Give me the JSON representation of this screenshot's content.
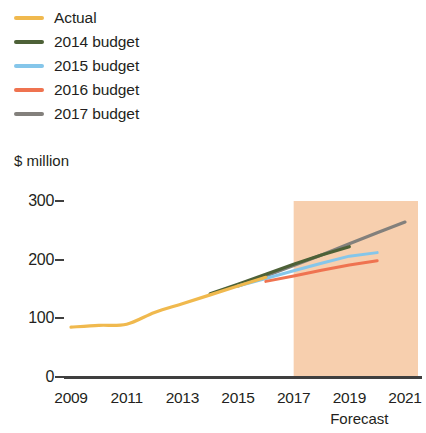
{
  "legend": {
    "items": [
      {
        "label": "Actual",
        "color": "#f0b94e",
        "key": "actual"
      },
      {
        "label": "2014 budget",
        "color": "#4d6137",
        "key": "budget2014"
      },
      {
        "label": "2015 budget",
        "color": "#85c6ea",
        "key": "budget2015"
      },
      {
        "label": "2016 budget",
        "color": "#ef7350",
        "key": "budget2016"
      },
      {
        "label": "2017 budget",
        "color": "#83807c",
        "key": "budget2017"
      }
    ]
  },
  "axes": {
    "y_title": "$ million",
    "y_ticks": [
      "300",
      "200",
      "100",
      "0"
    ],
    "x_ticks": [
      "2009",
      "2011",
      "2013",
      "2015",
      "2017",
      "2019",
      "2021"
    ],
    "forecast_caption": "Forecast"
  },
  "colors": {
    "forecast_band": "#f7cfae",
    "axis": "#3f3f3f",
    "text": "#231f20"
  },
  "chart_data": {
    "type": "line",
    "title": "",
    "xlabel": "",
    "ylabel": "$ million",
    "xlim": [
      2009,
      2021
    ],
    "ylim": [
      0,
      300
    ],
    "yticks": [
      0,
      100,
      200,
      300
    ],
    "xticks": [
      2009,
      2011,
      2013,
      2015,
      2017,
      2019,
      2021
    ],
    "grid": false,
    "legend_position": "top-left",
    "annotations": [
      {
        "text": "Forecast",
        "x_start": 2017,
        "x_end": 2021,
        "type": "shaded-band",
        "color": "#f7cfae"
      }
    ],
    "series": [
      {
        "name": "Actual",
        "color": "#f0b94e",
        "x": [
          2009,
          2010,
          2011,
          2012,
          2013,
          2014,
          2015,
          2016
        ],
        "values": [
          85,
          88,
          90,
          110,
          125,
          140,
          155,
          170
        ]
      },
      {
        "name": "2014 budget",
        "color": "#4d6137",
        "x": [
          2014,
          2015,
          2016,
          2017,
          2018,
          2019
        ],
        "values": [
          142,
          158,
          175,
          192,
          208,
          222
        ]
      },
      {
        "name": "2015 budget",
        "color": "#85c6ea",
        "x": [
          2015,
          2016,
          2017,
          2018,
          2019,
          2020
        ],
        "values": [
          155,
          168,
          181,
          194,
          206,
          212
        ]
      },
      {
        "name": "2016 budget",
        "color": "#ef7350",
        "x": [
          2016,
          2017,
          2018,
          2019,
          2020
        ],
        "values": [
          163,
          172,
          182,
          191,
          198
        ]
      },
      {
        "name": "2017 budget",
        "color": "#83807c",
        "x": [
          2015,
          2016,
          2017,
          2018,
          2019,
          2020,
          2021
        ],
        "values": [
          155,
          172,
          190,
          208,
          227,
          246,
          264
        ]
      }
    ]
  }
}
